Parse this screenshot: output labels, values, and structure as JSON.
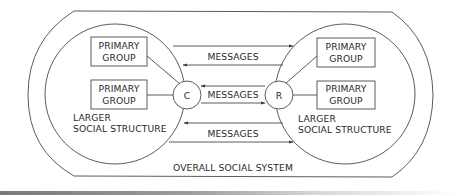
{
  "diagram": {
    "outer_system": {
      "label": "OVERALL SOCIAL SYSTEM"
    },
    "left_structure": {
      "label_line1": "LARGER",
      "label_line2": "SOCIAL STRUCTURE",
      "groups": [
        {
          "line1": "PRIMARY",
          "line2": "GROUP"
        },
        {
          "line1": "PRIMARY",
          "line2": "GROUP"
        }
      ],
      "node": {
        "label": "C"
      }
    },
    "right_structure": {
      "label_line1": "LARGER",
      "label_line2": "SOCIAL STRUCTURE",
      "groups": [
        {
          "line1": "PRIMARY",
          "line2": "GROUP"
        },
        {
          "line1": "PRIMARY",
          "line2": "GROUP"
        }
      ],
      "node": {
        "label": "R"
      }
    },
    "channels": [
      {
        "label": "MESSAGES",
        "position": "top",
        "arrows": [
          "left-to-right",
          "right-to-left"
        ]
      },
      {
        "label": "MESSAGES",
        "position": "middle",
        "arrows": [
          "right-to-left",
          "left-to-right"
        ]
      },
      {
        "label": "MESSAGES",
        "position": "bottom",
        "arrows": [
          "right-to-left",
          "left-to-right"
        ]
      }
    ],
    "colors": {
      "line": "#4a4a4a",
      "text": "#2a2a2a",
      "background": "#ffffff"
    }
  }
}
